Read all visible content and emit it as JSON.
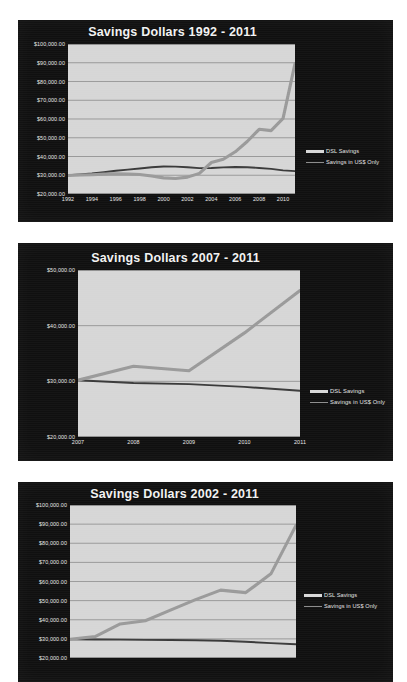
{
  "document": {
    "background_color": "#ffffff",
    "panel_color": "#101010",
    "plot_color": "#d6d6d6"
  },
  "legend": {
    "dsl_label": "DSL Savings",
    "usd_label": "Savings in US$ Only",
    "dsl_color": "#9a9a9a",
    "usd_color": "#3a3a3a",
    "position": "right"
  },
  "chart_data": [
    {
      "id": "chart-1992-2011",
      "type": "line",
      "title": "Savings Dollars 1992 - 2011",
      "xlabel": "",
      "ylabel": "",
      "grid": true,
      "legend_position": "right",
      "ylim": [
        20000,
        100000
      ],
      "yticks": [
        100000,
        90000,
        80000,
        70000,
        60000,
        50000,
        40000,
        30000,
        20000
      ],
      "ytick_labels": [
        "$100,000.00",
        "$90,000.00",
        "$80,000.00",
        "$70,000.00",
        "$60,000.00",
        "$50,000.00",
        "$40,000.00",
        "$30,000.00",
        "$20,000.00"
      ],
      "xlim": [
        1992,
        2011
      ],
      "xticks": [
        1992,
        1994,
        1996,
        1998,
        2000,
        2002,
        2004,
        2006,
        2008,
        2010
      ],
      "xtick_labels": [
        "1992",
        "1994",
        "1996",
        "1998",
        "2000",
        "2002",
        "2004",
        "2006",
        "2008",
        "2010"
      ],
      "x": [
        1992,
        1993,
        1994,
        1995,
        1996,
        1997,
        1998,
        1999,
        2000,
        2001,
        2002,
        2003,
        2004,
        2005,
        2006,
        2007,
        2008,
        2009,
        2010,
        2011
      ],
      "series": [
        {
          "name": "Savings in US$ Only",
          "values": [
            30000,
            30400,
            30900,
            31600,
            32400,
            33000,
            33600,
            34300,
            34700,
            34600,
            34300,
            33800,
            33900,
            34200,
            34400,
            34300,
            33900,
            33400,
            32600,
            32200
          ]
        },
        {
          "name": "DSL Savings",
          "values": [
            29900,
            30100,
            30300,
            30600,
            30800,
            30700,
            30400,
            29600,
            28600,
            28300,
            29000,
            31000,
            36800,
            38500,
            42500,
            48000,
            54500,
            53800,
            60300,
            89500
          ]
        }
      ]
    },
    {
      "id": "chart-2007-2011",
      "type": "line",
      "title": "Savings Dollars 2007 - 2011",
      "xlabel": "",
      "ylabel": "",
      "grid": true,
      "legend_position": "right",
      "ylim": [
        20000,
        50000
      ],
      "yticks": [
        50000,
        40000,
        30000,
        20000
      ],
      "ytick_labels": [
        "$50,000.00",
        "$40,000.00",
        "$30,000.00",
        "$20,000.00"
      ],
      "xlim": [
        2007,
        2011
      ],
      "xticks": [
        2007,
        2008,
        2009,
        2010,
        2011
      ],
      "xtick_labels": [
        "2007",
        "2008",
        "2009",
        "2010",
        "2011"
      ],
      "x": [
        2007,
        2008,
        2009,
        2010,
        2011
      ],
      "series": [
        {
          "name": "Savings in US$ Only",
          "values": [
            30200,
            29700,
            29500,
            29000,
            28300
          ]
        },
        {
          "name": "DSL Savings",
          "values": [
            30200,
            32700,
            31900,
            38700,
            46300
          ]
        }
      ]
    },
    {
      "id": "chart-2002-2011",
      "type": "line",
      "title": "Savings Dollars 2002 - 2011",
      "xlabel": "",
      "ylabel": "",
      "grid": true,
      "legend_position": "right",
      "ylim": [
        20000,
        100000
      ],
      "yticks": [
        100000,
        90000,
        80000,
        70000,
        60000,
        50000,
        40000,
        30000,
        20000
      ],
      "ytick_labels": [
        "$100,000.00",
        "$90,000.00",
        "$80,000.00",
        "$70,000.00",
        "$60,000.00",
        "$50,000.00",
        "$40,000.00",
        "$30,000.00",
        "$20,000.00"
      ],
      "xlim": [
        2002,
        2011
      ],
      "xticks": [],
      "xtick_labels": [],
      "x": [
        2002,
        2003,
        2004,
        2005,
        2006,
        2007,
        2008,
        2009,
        2010,
        2011
      ],
      "series": [
        {
          "name": "Savings in US$ Only",
          "values": [
            29800,
            29700,
            29600,
            29500,
            29400,
            29300,
            29000,
            28500,
            27800,
            27200
          ]
        },
        {
          "name": "DSL Savings",
          "values": [
            29800,
            31200,
            37800,
            39500,
            45000,
            50500,
            55500,
            54200,
            64000,
            89300
          ]
        }
      ]
    }
  ]
}
